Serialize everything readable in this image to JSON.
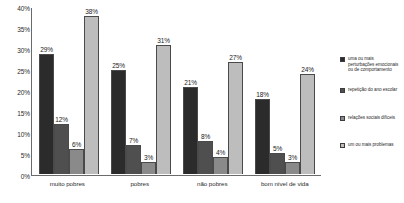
{
  "chart_data": {
    "type": "bar",
    "title": "",
    "xlabel": "",
    "ylabel": "",
    "ylim": [
      0,
      40
    ],
    "ytick_labels": [
      "40%",
      "35%",
      "30%",
      "25%",
      "20%",
      "15%",
      "10%",
      "5%",
      "0%"
    ],
    "ytick_values": [
      40,
      35,
      30,
      25,
      20,
      15,
      10,
      5,
      0
    ],
    "grid": false,
    "legend_position": "right",
    "categories": [
      "muito pobres",
      "pobres",
      "não pobres",
      "bom nível de vida"
    ],
    "series": [
      {
        "name": "uma ou mais perturbações emocionais ou de comportamento",
        "color": "#2b2b2b",
        "values": [
          29,
          25,
          21,
          18
        ],
        "labels": [
          "29%",
          "25%",
          "21%",
          "18%"
        ]
      },
      {
        "name": "repetição do ano escolar",
        "color": "#4f4f4f",
        "values": [
          12,
          7,
          8,
          5
        ],
        "labels": [
          "12%",
          "7%",
          "8%",
          "5%"
        ]
      },
      {
        "name": "relações sociais difíceis",
        "color": "#8a8a8a",
        "values": [
          6,
          3,
          4,
          3
        ],
        "labels": [
          "6%",
          "3%",
          "4%",
          "3%"
        ]
      },
      {
        "name": "um ou mais problemas",
        "color": "#bdbdbd",
        "values": [
          38,
          31,
          27,
          24
        ],
        "labels": [
          "38%",
          "31%",
          "27%",
          "24%"
        ]
      }
    ]
  }
}
